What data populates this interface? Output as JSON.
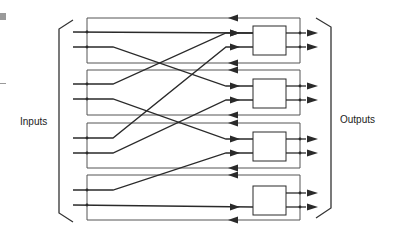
{
  "labels": {
    "inputs": "Inputs",
    "outputs": "Outputs"
  },
  "colors": {
    "line": "#2a2a2a",
    "feedback": "#555555",
    "bracket": "#333333",
    "box_fill": "#ffffff",
    "edge_mark": "#9a9a9a"
  },
  "diagram": {
    "type": "interconnection-network",
    "switch_count": 4,
    "input_count": 8,
    "output_count": 8,
    "input_y": [
      32,
      47,
      84,
      99,
      138,
      153,
      190,
      205
    ],
    "boxes": [
      {
        "x": 253,
        "y": 26,
        "w": 33,
        "h": 29,
        "in_y": [
          33,
          47
        ]
      },
      {
        "x": 253,
        "y": 79,
        "w": 33,
        "h": 29,
        "in_y": [
          86,
          100
        ]
      },
      {
        "x": 253,
        "y": 132,
        "w": 33,
        "h": 29,
        "in_y": [
          139,
          153
        ]
      },
      {
        "x": 253,
        "y": 186,
        "w": 33,
        "h": 29,
        "in_y": [
          193,
          207
        ]
      }
    ],
    "connections": [
      {
        "from": 32,
        "to": 33
      },
      {
        "from": 47,
        "to": 86
      },
      {
        "from": 84,
        "to": 33
      },
      {
        "from": 99,
        "to": 139
      },
      {
        "from": 138,
        "to": 47
      },
      {
        "from": 153,
        "to": 100
      },
      {
        "from": 190,
        "to": 153
      },
      {
        "from": 205,
        "to": 207
      }
    ],
    "feedback_y": [
      18,
      63,
      70,
      115,
      123,
      168,
      175,
      220
    ]
  }
}
